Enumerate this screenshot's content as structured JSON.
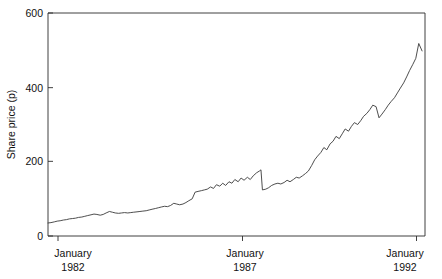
{
  "chart_data": {
    "type": "line",
    "title": "",
    "xlabel": "",
    "ylabel": "Share price (p)",
    "ylim": [
      0,
      600
    ],
    "xlim": [
      1982.0,
      1992.25
    ],
    "grid": false,
    "legend": null,
    "y_ticks": [
      0,
      200,
      400,
      600
    ],
    "y_tick_labels": [
      "0",
      "200",
      "400",
      "600"
    ],
    "x_ticks": [
      1982.0,
      1987.0,
      1992.0
    ],
    "x_tick_labels": [
      {
        "month": "January",
        "year": "1982"
      },
      {
        "month": "January",
        "year": "1987"
      },
      {
        "month": "January",
        "year": "1992"
      }
    ],
    "series": [
      {
        "name": "Share price",
        "color": "#3a3a3a",
        "x": [
          1982.0,
          1982.08,
          1982.17,
          1982.25,
          1982.33,
          1982.42,
          1982.5,
          1982.58,
          1982.67,
          1982.75,
          1982.83,
          1982.92,
          1983.0,
          1983.08,
          1983.17,
          1983.25,
          1983.33,
          1983.42,
          1983.5,
          1983.58,
          1983.67,
          1983.75,
          1983.83,
          1983.92,
          1984.0,
          1984.08,
          1984.17,
          1984.25,
          1984.33,
          1984.42,
          1984.5,
          1984.58,
          1984.67,
          1984.75,
          1984.83,
          1984.92,
          1985.0,
          1985.08,
          1985.17,
          1985.25,
          1985.33,
          1985.42,
          1985.5,
          1985.58,
          1985.67,
          1985.75,
          1985.83,
          1985.92,
          1986.0,
          1986.08,
          1986.17,
          1986.25,
          1986.33,
          1986.42,
          1986.5,
          1986.58,
          1986.67,
          1986.75,
          1986.83,
          1986.92,
          1987.0,
          1987.08,
          1987.17,
          1987.25,
          1987.33,
          1987.42,
          1987.5,
          1987.58,
          1987.67,
          1987.75,
          1987.79,
          1987.83,
          1987.92,
          1988.0,
          1988.08,
          1988.17,
          1988.25,
          1988.33,
          1988.42,
          1988.5,
          1988.58,
          1988.67,
          1988.75,
          1988.83,
          1988.92,
          1989.0,
          1989.08,
          1989.17,
          1989.25,
          1989.33,
          1989.42,
          1989.5,
          1989.58,
          1989.67,
          1989.75,
          1989.83,
          1989.92,
          1990.0,
          1990.08,
          1990.17,
          1990.25,
          1990.33,
          1990.42,
          1990.5,
          1990.58,
          1990.67,
          1990.75,
          1990.83,
          1990.92,
          1991.0,
          1991.08,
          1991.17,
          1991.25,
          1991.33,
          1991.42,
          1991.5,
          1991.58,
          1991.67,
          1991.75,
          1991.83,
          1991.92,
          1992.0,
          1992.08,
          1992.17
        ],
        "y": [
          35,
          36,
          38,
          40,
          41,
          43,
          44,
          46,
          47,
          48,
          50,
          51,
          53,
          55,
          57,
          59,
          58,
          56,
          58,
          62,
          66,
          64,
          62,
          61,
          62,
          63,
          62,
          63,
          64,
          65,
          66,
          67,
          68,
          70,
          72,
          74,
          76,
          78,
          80,
          79,
          82,
          88,
          86,
          84,
          86,
          90,
          95,
          100,
          118,
          120,
          122,
          124,
          126,
          132,
          128,
          138,
          134,
          142,
          136,
          146,
          142,
          152,
          146,
          156,
          150,
          158,
          152,
          162,
          170,
          175,
          178,
          124,
          126,
          130,
          136,
          140,
          142,
          140,
          144,
          150,
          146,
          152,
          158,
          156,
          162,
          168,
          175,
          190,
          205,
          215,
          225,
          238,
          232,
          248,
          255,
          268,
          262,
          275,
          288,
          282,
          295,
          305,
          300,
          310,
          322,
          330,
          340,
          352,
          348,
          318,
          328,
          340,
          352,
          362,
          372,
          385,
          398,
          412,
          428,
          445,
          462,
          478,
          518,
          498
        ]
      }
    ],
    "annotations": []
  },
  "figure": {
    "background_color": "#ffffff",
    "axis_color": "#2b2b2b",
    "line_color": "#3a3a3a"
  }
}
